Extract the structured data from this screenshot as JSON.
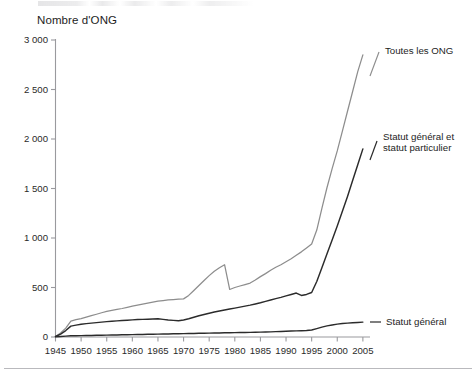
{
  "chart_data": {
    "type": "line",
    "title": "",
    "ylabel": "Nombre d'ONG",
    "xlabel": "",
    "xlim": [
      1945,
      2006
    ],
    "ylim": [
      0,
      3000
    ],
    "grid": false,
    "legend_position": "right-inline",
    "y_ticks": [
      "0",
      "500",
      "1 000",
      "1 500",
      "2 000",
      "2 500",
      "3 000"
    ],
    "y_tick_values": [
      0,
      500,
      1000,
      1500,
      2000,
      2500,
      3000
    ],
    "x_ticks": [
      "1945",
      "1950",
      "1955",
      "1960",
      "1965",
      "1970",
      "1975",
      "1980",
      "1985",
      "1990",
      "1995",
      "2000",
      "2005"
    ],
    "x_tick_values": [
      1945,
      1950,
      1955,
      1960,
      1965,
      1970,
      1975,
      1980,
      1985,
      1990,
      1995,
      2000,
      2005
    ],
    "series": [
      {
        "name": "Toutes les ONG",
        "color": "#8d8d8d",
        "label_lines": [
          "Toutes les ONG"
        ],
        "x": [
          1945,
          1946,
          1947,
          1948,
          1949,
          1950,
          1951,
          1952,
          1953,
          1954,
          1955,
          1956,
          1957,
          1958,
          1959,
          1960,
          1961,
          1962,
          1963,
          1964,
          1965,
          1966,
          1967,
          1968,
          1969,
          1970,
          1971,
          1972,
          1973,
          1974,
          1975,
          1976,
          1977,
          1978,
          1979,
          1980,
          1981,
          1982,
          1983,
          1984,
          1985,
          1986,
          1987,
          1988,
          1989,
          1990,
          1991,
          1992,
          1993,
          1994,
          1995,
          1996,
          1997,
          1998,
          1999,
          2000,
          2001,
          2002,
          2003,
          2004,
          2005
        ],
        "values": [
          5,
          40,
          90,
          160,
          175,
          185,
          200,
          215,
          230,
          245,
          258,
          268,
          278,
          288,
          300,
          312,
          322,
          332,
          342,
          352,
          362,
          368,
          374,
          378,
          382,
          385,
          420,
          470,
          520,
          570,
          620,
          665,
          700,
          730,
          480,
          500,
          515,
          530,
          545,
          575,
          610,
          640,
          675,
          705,
          730,
          760,
          790,
          825,
          860,
          900,
          940,
          1080,
          1300,
          1510,
          1700,
          1880,
          2080,
          2280,
          2480,
          2680,
          2850
        ]
      },
      {
        "name": "Statut général et statut particulier",
        "color": "#2b2b2b",
        "label_lines": [
          "Statut général et",
          "statut particulier"
        ],
        "x": [
          1945,
          1946,
          1947,
          1948,
          1949,
          1950,
          1951,
          1952,
          1953,
          1954,
          1955,
          1956,
          1957,
          1958,
          1959,
          1960,
          1961,
          1962,
          1963,
          1964,
          1965,
          1966,
          1967,
          1968,
          1969,
          1970,
          1971,
          1972,
          1973,
          1974,
          1975,
          1976,
          1977,
          1978,
          1979,
          1980,
          1981,
          1982,
          1983,
          1984,
          1985,
          1986,
          1987,
          1988,
          1989,
          1990,
          1991,
          1992,
          1993,
          1994,
          1995,
          1996,
          1997,
          1998,
          1999,
          2000,
          2001,
          2002,
          2003,
          2004,
          2005
        ],
        "values": [
          5,
          30,
          65,
          110,
          120,
          128,
          135,
          140,
          145,
          150,
          155,
          160,
          163,
          166,
          170,
          173,
          176,
          178,
          180,
          182,
          184,
          178,
          172,
          168,
          165,
          172,
          185,
          200,
          215,
          228,
          240,
          252,
          262,
          272,
          282,
          292,
          302,
          312,
          322,
          334,
          346,
          360,
          374,
          388,
          400,
          415,
          430,
          444,
          420,
          430,
          450,
          560,
          700,
          840,
          980,
          1120,
          1270,
          1420,
          1580,
          1740,
          1900
        ]
      },
      {
        "name": "Statut général",
        "color": "#2b2b2b",
        "label_lines": [
          "Statut général"
        ],
        "x": [
          1945,
          1946,
          1947,
          1948,
          1949,
          1950,
          1951,
          1952,
          1953,
          1954,
          1955,
          1956,
          1957,
          1958,
          1959,
          1960,
          1961,
          1962,
          1963,
          1964,
          1965,
          1966,
          1967,
          1968,
          1969,
          1970,
          1971,
          1972,
          1973,
          1974,
          1975,
          1976,
          1977,
          1978,
          1979,
          1980,
          1981,
          1982,
          1983,
          1984,
          1985,
          1986,
          1987,
          1988,
          1989,
          1990,
          1991,
          1992,
          1993,
          1994,
          1995,
          1996,
          1997,
          1998,
          1999,
          2000,
          2001,
          2002,
          2003,
          2004,
          2005
        ],
        "values": [
          3,
          6,
          9,
          12,
          13,
          14,
          15,
          16,
          17,
          18,
          19,
          20,
          21,
          22,
          23,
          24,
          25,
          26,
          27,
          28,
          29,
          30,
          31,
          32,
          33,
          34,
          35,
          36,
          37,
          38,
          39,
          40,
          41,
          42,
          43,
          44,
          45,
          46,
          47,
          48,
          49,
          50,
          52,
          54,
          56,
          58,
          60,
          62,
          64,
          66,
          70,
          85,
          100,
          112,
          122,
          130,
          136,
          140,
          144,
          147,
          150
        ]
      }
    ]
  }
}
